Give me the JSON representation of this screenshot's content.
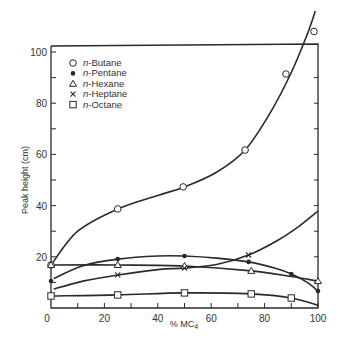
{
  "chart_data": {
    "type": "line",
    "title": "",
    "xlabel": "% MC4",
    "xlabel_main": "% MC",
    "xlabel_sub": "4",
    "ylabel": "Peak height (cm)",
    "xlim": [
      0,
      100
    ],
    "ylim": [
      0,
      100
    ],
    "xticks": [
      0,
      20,
      40,
      60,
      80,
      100
    ],
    "yticks": [
      20,
      40,
      60,
      80,
      100
    ],
    "grid": false,
    "legend_position": "upper-left",
    "series": [
      {
        "name": "n-Butane",
        "prefix": "n",
        "suffix": "-Butane",
        "marker": "open-circle",
        "points": [
          [
            0,
            16.8
          ],
          [
            25,
            38.7
          ],
          [
            49.5,
            47.3
          ],
          [
            72.7,
            61.7
          ],
          [
            88,
            91.4
          ],
          [
            98.5,
            108
          ]
        ],
        "curve": [
          [
            0,
            16.8
          ],
          [
            10,
            30
          ],
          [
            25,
            38.7
          ],
          [
            40,
            44
          ],
          [
            50,
            47.3
          ],
          [
            62,
            53
          ],
          [
            72.7,
            61.7
          ],
          [
            82,
            76
          ],
          [
            90,
            92
          ],
          [
            96,
            107
          ],
          [
            99,
            116
          ]
        ]
      },
      {
        "name": "n-Pentane",
        "prefix": "n",
        "suffix": "-Pentane",
        "marker": "filled-circle",
        "points": [
          [
            0,
            10.5
          ],
          [
            25,
            19.1
          ],
          [
            50,
            20.3
          ],
          [
            74,
            18
          ],
          [
            90,
            13.3
          ],
          [
            100,
            6.6
          ]
        ],
        "curve": [
          [
            1,
            11.5
          ],
          [
            12,
            16.5
          ],
          [
            25,
            19.1
          ],
          [
            40,
            20.3
          ],
          [
            50,
            20.3
          ],
          [
            62,
            19.5
          ],
          [
            74,
            18
          ],
          [
            84,
            15.5
          ],
          [
            90,
            13.3
          ],
          [
            96,
            10
          ],
          [
            100,
            6.6
          ]
        ]
      },
      {
        "name": "n-Hexane",
        "prefix": "n",
        "suffix": "-Hexane",
        "marker": "open-triangle",
        "points": [
          [
            0,
            16.8
          ],
          [
            25,
            16.8
          ],
          [
            50,
            16.4
          ],
          [
            75,
            14.5
          ],
          [
            100,
            10.5
          ]
        ],
        "curve": [
          [
            0,
            16.8
          ],
          [
            25,
            16.8
          ],
          [
            50,
            16.4
          ],
          [
            75,
            14.5
          ],
          [
            90,
            12.3
          ],
          [
            100,
            10.5
          ]
        ]
      },
      {
        "name": "n-Heptane",
        "prefix": "n",
        "suffix": "-Heptane",
        "marker": "x",
        "points": [
          [
            25,
            12.9
          ],
          [
            50,
            15.6
          ],
          [
            74,
            20.7
          ]
        ],
        "curve": [
          [
            1,
            7.4
          ],
          [
            12,
            10.5
          ],
          [
            25,
            12.9
          ],
          [
            40,
            15
          ],
          [
            50,
            15.6
          ],
          [
            62,
            17
          ],
          [
            74,
            20.7
          ],
          [
            85,
            26.5
          ],
          [
            93,
            32
          ],
          [
            100,
            37.9
          ]
        ]
      },
      {
        "name": "n-Octane",
        "prefix": "n",
        "suffix": "-Octane",
        "marker": "open-square",
        "points": [
          [
            0,
            4.7
          ],
          [
            25,
            5.1
          ],
          [
            50,
            5.9
          ],
          [
            75,
            5.5
          ],
          [
            90,
            3.9
          ]
        ],
        "curve": [
          [
            0,
            4.7
          ],
          [
            25,
            5.1
          ],
          [
            50,
            5.9
          ],
          [
            75,
            5.5
          ],
          [
            90,
            3.9
          ],
          [
            100,
            1
          ]
        ]
      }
    ]
  }
}
